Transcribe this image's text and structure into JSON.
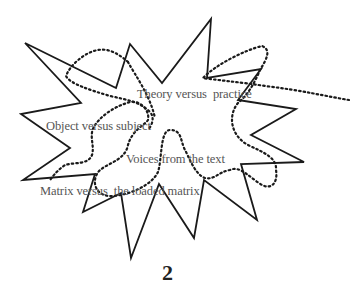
{
  "diagram": {
    "labels": [
      {
        "text": "Theory versus  practice",
        "x": 137,
        "y": 88
      },
      {
        "text": "Object versus subject",
        "x": 46,
        "y": 120
      },
      {
        "text": "Voices from the text",
        "x": 126,
        "y": 153
      },
      {
        "text": "Matrix versus  the loaded matrix",
        "x": 40,
        "y": 185
      }
    ],
    "page_number": "2",
    "colors": {
      "outline": "#1a1a1a",
      "dotted": "#1a1a1a",
      "text": "#555555"
    }
  }
}
